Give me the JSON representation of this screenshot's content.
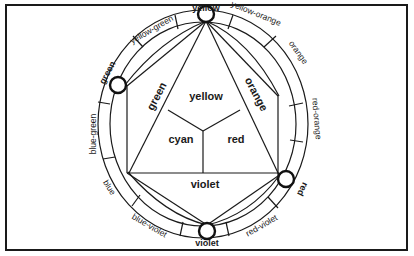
{
  "diagram": {
    "type": "color-wheel",
    "outer_ring_labels": {
      "yellow": "yellow",
      "yellow_orange": "yellow-orange",
      "orange": "orange",
      "red_orange": "red-orange",
      "red": "red",
      "red_violet": "red-violet",
      "violet": "violet",
      "blue_violet": "blue-violet",
      "blue": "blue",
      "blue_green": "blue-green",
      "green": "green",
      "yellow_green": "yellow-green"
    },
    "inner_regions": {
      "yellow": "yellow",
      "green": "green",
      "orange": "orange",
      "cyan": "cyan",
      "red": "red",
      "violet": "violet"
    },
    "primary_markers": [
      "yellow",
      "red",
      "violet",
      "green"
    ],
    "colors": {
      "stroke": "#1a1a1a",
      "background": "#ffffff"
    }
  }
}
